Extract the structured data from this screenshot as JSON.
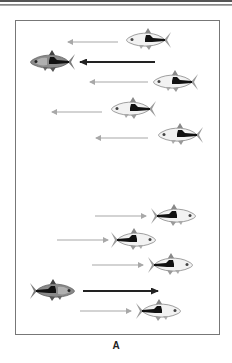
{
  "figure": {
    "panel_label": "A",
    "colors": {
      "frame": "#777777",
      "grey_arrow": "#a8a8a8",
      "dark_arrow": "#333333",
      "pale_fish_body": "#f2f2f2",
      "dark_fish_body": "#8a8a8a",
      "fish_stripe": "#111111",
      "fin": "#9a9a9a"
    },
    "top_group": {
      "direction": "left",
      "fish": [
        {
          "id": "top-fish-1",
          "x": 148,
          "y": 40,
          "tone": "pale"
        },
        {
          "id": "top-leader",
          "x": 52,
          "y": 62,
          "tone": "dark"
        },
        {
          "id": "top-fish-3",
          "x": 175,
          "y": 82,
          "tone": "pale"
        },
        {
          "id": "top-fish-4",
          "x": 133,
          "y": 109,
          "tone": "pale"
        },
        {
          "id": "top-fish-5",
          "x": 180,
          "y": 135,
          "tone": "pale"
        }
      ],
      "arrows": [
        {
          "x1": 118,
          "x2": 68,
          "y": 42,
          "tone": "grey"
        },
        {
          "x1": 155,
          "x2": 80,
          "y": 62,
          "tone": "dark"
        },
        {
          "x1": 148,
          "x2": 90,
          "y": 82,
          "tone": "grey"
        },
        {
          "x1": 102,
          "x2": 52,
          "y": 112,
          "tone": "grey"
        },
        {
          "x1": 148,
          "x2": 96,
          "y": 138,
          "tone": "grey"
        }
      ]
    },
    "bottom_group": {
      "direction": "right",
      "fish": [
        {
          "id": "bottom-fish-1",
          "x": 174,
          "y": 216,
          "tone": "pale"
        },
        {
          "id": "bottom-fish-2",
          "x": 134,
          "y": 240,
          "tone": "pale"
        },
        {
          "id": "bottom-fish-3",
          "x": 171,
          "y": 265,
          "tone": "pale"
        },
        {
          "id": "bottom-leader",
          "x": 53,
          "y": 291,
          "tone": "dark"
        },
        {
          "id": "bottom-fish-5",
          "x": 159,
          "y": 311,
          "tone": "pale"
        }
      ],
      "arrows": [
        {
          "x1": 95,
          "x2": 146,
          "y": 216,
          "tone": "grey"
        },
        {
          "x1": 57,
          "x2": 108,
          "y": 240,
          "tone": "grey"
        },
        {
          "x1": 92,
          "x2": 143,
          "y": 265,
          "tone": "grey"
        },
        {
          "x1": 83,
          "x2": 158,
          "y": 291,
          "tone": "dark"
        },
        {
          "x1": 80,
          "x2": 131,
          "y": 311,
          "tone": "grey"
        }
      ]
    }
  }
}
